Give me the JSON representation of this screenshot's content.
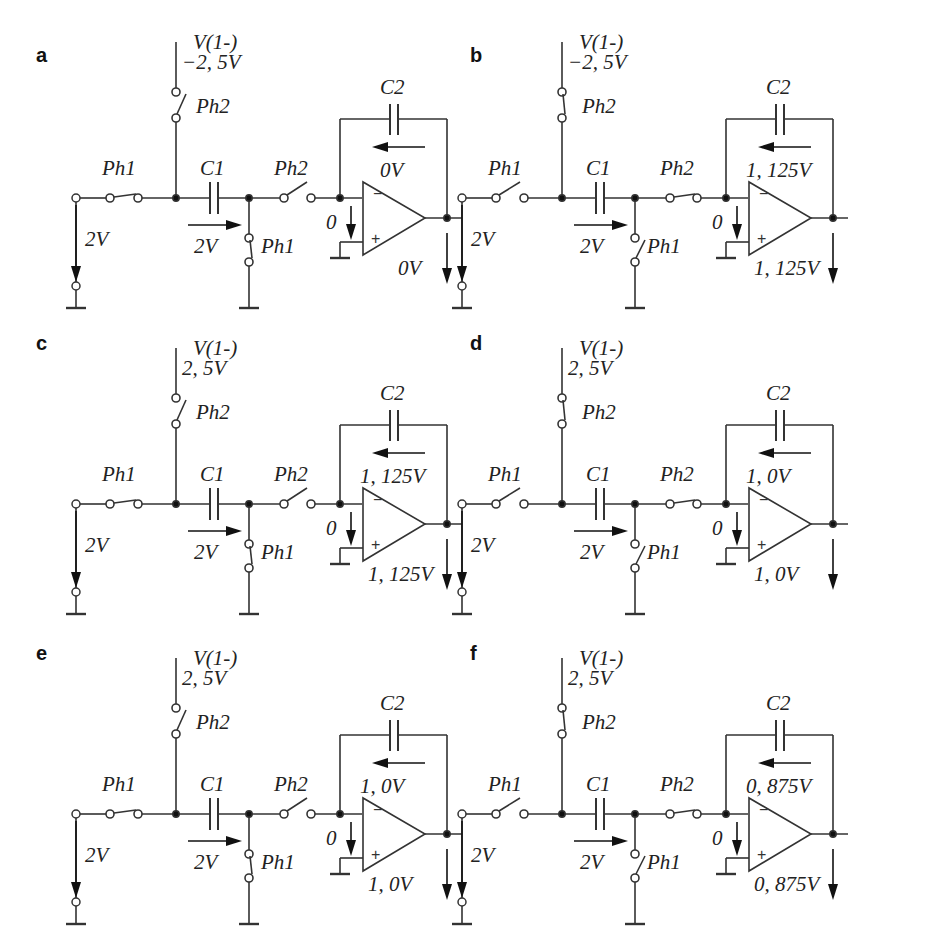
{
  "figure": {
    "panels": [
      {
        "id": "a",
        "label": "a",
        "vref_name": "V(1-)",
        "vref_value": "−2, 5V",
        "ph1_label": "Ph1",
        "ph2_label": "Ph2",
        "c1_label": "C1",
        "c2_label": "C2",
        "vin": "2V",
        "vc1": "2V",
        "vinv": "0",
        "vc2": "0V",
        "vout": "0V",
        "phase": "Ph1 closed",
        "ph1_closed": true,
        "ph2_closed": false
      },
      {
        "id": "b",
        "label": "b",
        "vref_name": "V(1-)",
        "vref_value": "−2, 5V",
        "ph1_label": "Ph1",
        "ph2_label": "Ph2",
        "c1_label": "C1",
        "c2_label": "C2",
        "vin": "2V",
        "vc1": "2V",
        "vinv": "0",
        "vc2": "1, 125V",
        "vout": "1, 125V",
        "phase": "Ph2 closed",
        "ph1_closed": false,
        "ph2_closed": true
      },
      {
        "id": "c",
        "label": "c",
        "vref_name": "V(1-)",
        "vref_value": "2, 5V",
        "ph1_label": "Ph1",
        "ph2_label": "Ph2",
        "c1_label": "C1",
        "c2_label": "C2",
        "vin": "2V",
        "vc1": "2V",
        "vinv": "0",
        "vc2": "1, 125V",
        "vout": "1, 125V",
        "phase": "Ph1 closed",
        "ph1_closed": true,
        "ph2_closed": false
      },
      {
        "id": "d",
        "label": "d",
        "vref_name": "V(1-)",
        "vref_value": "2, 5V",
        "ph1_label": "Ph1",
        "ph2_label": "Ph2",
        "c1_label": "C1",
        "c2_label": "C2",
        "vin": "2V",
        "vc1": "2V",
        "vinv": "0",
        "vc2": "1, 0V",
        "vout": "1, 0V",
        "phase": "Ph2 closed",
        "ph1_closed": false,
        "ph2_closed": true
      },
      {
        "id": "e",
        "label": "e",
        "vref_name": "V(1-)",
        "vref_value": "2, 5V",
        "ph1_label": "Ph1",
        "ph2_label": "Ph2",
        "c1_label": "C1",
        "c2_label": "C2",
        "vin": "2V",
        "vc1": "2V",
        "vinv": "0",
        "vc2": "1, 0V",
        "vout": "1, 0V",
        "phase": "Ph1 closed",
        "ph1_closed": true,
        "ph2_closed": false
      },
      {
        "id": "f",
        "label": "f",
        "vref_name": "V(1-)",
        "vref_value": "2, 5V",
        "ph1_label": "Ph1",
        "ph2_label": "Ph2",
        "c1_label": "C1",
        "c2_label": "C2",
        "vin": "2V",
        "vc1": "2V",
        "vinv": "0",
        "vc2": "0, 875V",
        "vout": "0, 875V",
        "phase": "Ph2 closed",
        "ph1_closed": false,
        "ph2_closed": true
      }
    ],
    "colors": {
      "line": "#333333",
      "text": "#222222",
      "background": "#ffffff"
    }
  }
}
